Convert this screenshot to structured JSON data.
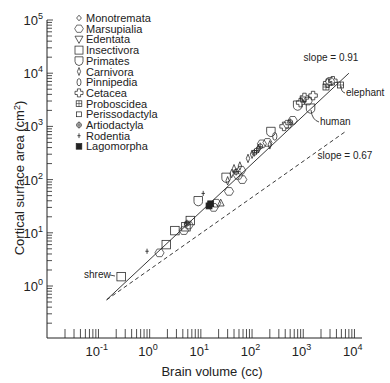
{
  "chart_data": {
    "type": "scatter",
    "title": "",
    "xlabel": "Brain volume (cc)",
    "ylabel": "Cortical surface area (cm2)",
    "xscale": "log",
    "yscale": "log",
    "xlim": [
      0.01,
      10000
    ],
    "ylim": [
      0.1,
      100000
    ],
    "x_tick_labels": [
      "10-1",
      "100",
      "101",
      "102",
      "103",
      "104"
    ],
    "x_tick_exponents": [
      -1,
      0,
      1,
      2,
      3,
      4
    ],
    "y_tick_labels": [
      "100",
      "101",
      "102",
      "103",
      "104",
      "105"
    ],
    "y_tick_exponents": [
      0,
      1,
      2,
      3,
      4,
      5
    ],
    "legend": [
      {
        "name": "Monotremata",
        "marker": "small-diamond"
      },
      {
        "name": "Marsupialia",
        "marker": "hexagon"
      },
      {
        "name": "Edentata",
        "marker": "triangle-down"
      },
      {
        "name": "Insectivora",
        "marker": "square"
      },
      {
        "name": "Primates",
        "marker": "shield"
      },
      {
        "name": "Carnivora",
        "marker": "thin-diamond"
      },
      {
        "name": "Pinnipedia",
        "marker": "oval"
      },
      {
        "name": "Cetacea",
        "marker": "flower"
      },
      {
        "name": "Proboscidea",
        "marker": "grid-square"
      },
      {
        "name": "Perissodactyla",
        "marker": "small-square"
      },
      {
        "name": "Artiodactyla",
        "marker": "circle-plus"
      },
      {
        "name": "Rodentia",
        "marker": "plus"
      },
      {
        "name": "Lagomorpha",
        "marker": "filled-square"
      }
    ],
    "fit_lines": [
      {
        "label": "slope = 0.91",
        "style": "solid",
        "from": [
          0.13,
          0.55
        ],
        "to": [
          7000,
          10000
        ]
      },
      {
        "label": "slope = 0.67",
        "style": "dashed",
        "from": [
          0.13,
          0.55
        ],
        "to": [
          6000,
          800
        ]
      }
    ],
    "annotations": [
      {
        "text": "shrew",
        "x": 0.25,
        "y": 1.5
      },
      {
        "text": "human",
        "x": 1300,
        "y": 2200
      },
      {
        "text": "elephant",
        "x": 5000,
        "y": 6000
      }
    ],
    "points": [
      {
        "group": "Insectivora",
        "x": 0.25,
        "y": 1.5
      },
      {
        "group": "Rodentia",
        "x": 0.8,
        "y": 4.5
      },
      {
        "group": "Marsupialia",
        "x": 1.4,
        "y": 4.2
      },
      {
        "group": "Insectivora",
        "x": 1.9,
        "y": 6.0
      },
      {
        "group": "Insectivora",
        "x": 2.8,
        "y": 11
      },
      {
        "group": "Marsupialia",
        "x": 4.2,
        "y": 11
      },
      {
        "group": "Insectivora",
        "x": 4.6,
        "y": 13
      },
      {
        "group": "Artiodactyla",
        "x": 4.8,
        "y": 15
      },
      {
        "group": "Marsupialia",
        "x": 5.2,
        "y": 14
      },
      {
        "group": "Insectivora",
        "x": 5.6,
        "y": 17
      },
      {
        "group": "Primates",
        "x": 8.0,
        "y": 40
      },
      {
        "group": "Rodentia",
        "x": 10,
        "y": 55
      },
      {
        "group": "Lagomorpha",
        "x": 13,
        "y": 32
      },
      {
        "group": "Lagomorpha",
        "x": 14,
        "y": 35
      },
      {
        "group": "Marsupialia",
        "x": 16,
        "y": 30
      },
      {
        "group": "Marsupialia",
        "x": 18,
        "y": 36
      },
      {
        "group": "Edentata",
        "x": 22,
        "y": 37
      },
      {
        "group": "Primates",
        "x": 28,
        "y": 110
      },
      {
        "group": "Carnivora",
        "x": 30,
        "y": 95
      },
      {
        "group": "Marsupialia",
        "x": 32,
        "y": 60
      },
      {
        "group": "Carnivora",
        "x": 36,
        "y": 130
      },
      {
        "group": "Carnivora",
        "x": 40,
        "y": 160
      },
      {
        "group": "Artiodactyla",
        "x": 44,
        "y": 140
      },
      {
        "group": "Marsupialia",
        "x": 48,
        "y": 120
      },
      {
        "group": "Carnivora",
        "x": 52,
        "y": 180
      },
      {
        "group": "Marsupialia",
        "x": 55,
        "y": 150
      },
      {
        "group": "Marsupialia",
        "x": 58,
        "y": 100
      },
      {
        "group": "Carnivora",
        "x": 75,
        "y": 250
      },
      {
        "group": "Carnivora",
        "x": 90,
        "y": 300
      },
      {
        "group": "Artiodactyla",
        "x": 100,
        "y": 320
      },
      {
        "group": "Artiodactyla",
        "x": 110,
        "y": 350
      },
      {
        "group": "Carnivora",
        "x": 120,
        "y": 380
      },
      {
        "group": "Artiodactyla",
        "x": 130,
        "y": 420
      },
      {
        "group": "Marsupialia",
        "x": 140,
        "y": 470
      },
      {
        "group": "Marsupialia",
        "x": 180,
        "y": 500
      },
      {
        "group": "Primates",
        "x": 210,
        "y": 800
      },
      {
        "group": "Pinnipedia",
        "x": 250,
        "y": 650
      },
      {
        "group": "Carnivora",
        "x": 200,
        "y": 450
      },
      {
        "group": "Cetacea",
        "x": 380,
        "y": 1000
      },
      {
        "group": "Marsupialia",
        "x": 450,
        "y": 1100
      },
      {
        "group": "Artiodactyla",
        "x": 500,
        "y": 1200
      },
      {
        "group": "Marsupialia",
        "x": 560,
        "y": 1300
      },
      {
        "group": "Primates",
        "x": 700,
        "y": 2500
      },
      {
        "group": "Cetacea",
        "x": 800,
        "y": 2800
      },
      {
        "group": "Perissodactyla",
        "x": 900,
        "y": 3200
      },
      {
        "group": "Cetacea",
        "x": 950,
        "y": 3500
      },
      {
        "group": "Primates",
        "x": 1250,
        "y": 2200
      },
      {
        "group": "Marsupialia",
        "x": 1100,
        "y": 3000
      },
      {
        "group": "Cetacea",
        "x": 1400,
        "y": 3800
      },
      {
        "group": "Proboscidea",
        "x": 2500,
        "y": 5500
      },
      {
        "group": "Cetacea",
        "x": 2700,
        "y": 6500
      },
      {
        "group": "Marsupialia",
        "x": 3000,
        "y": 7000
      },
      {
        "group": "Cetacea",
        "x": 3400,
        "y": 7200
      },
      {
        "group": "Proboscidea",
        "x": 4800,
        "y": 6000
      }
    ]
  },
  "layout": {
    "x_decade0_px": 152,
    "x_px_per_decade": 51.2,
    "y_decade0_px": 286,
    "y_px_per_decade": 53.2,
    "axis_left": 47,
    "axis_bottom": 338,
    "axis_top": 20,
    "axis_right": 362
  }
}
